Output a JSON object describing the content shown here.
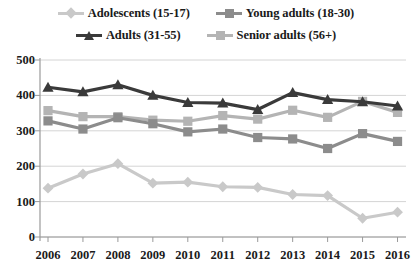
{
  "chart_data": {
    "type": "line",
    "title": "",
    "subtitle": "",
    "xlabel": "",
    "ylabel": "",
    "categories": [
      "2006",
      "2007",
      "2008",
      "2009",
      "2010",
      "2011",
      "2012",
      "2013",
      "2014",
      "2015",
      "2016"
    ],
    "x": [
      2006,
      2007,
      2008,
      2009,
      2010,
      2011,
      2012,
      2013,
      2014,
      2015,
      2016
    ],
    "ylim": [
      0,
      500
    ],
    "yticks": [
      0,
      100,
      200,
      300,
      400,
      500
    ],
    "grid": true,
    "legend_position": "top",
    "series": [
      {
        "name": "Adolescents (15-17)",
        "color": "#c9c9c9",
        "marker": "diamond",
        "values": [
          138,
          178,
          207,
          152,
          155,
          142,
          140,
          120,
          117,
          53,
          70
        ]
      },
      {
        "name": "Young adults (18-30)",
        "color": "#8c8c8c",
        "marker": "square",
        "values": [
          328,
          305,
          337,
          320,
          297,
          305,
          281,
          277,
          250,
          292,
          270
        ]
      },
      {
        "name": "Adults (31-55)",
        "color": "#3a3a3a",
        "marker": "triangle",
        "values": [
          423,
          410,
          430,
          400,
          380,
          378,
          360,
          408,
          388,
          382,
          370
        ]
      },
      {
        "name": "Senior adults (56+)",
        "color": "#b4b4b4",
        "marker": "square",
        "values": [
          357,
          340,
          340,
          330,
          327,
          343,
          333,
          358,
          338,
          383,
          352
        ]
      }
    ]
  },
  "legend": {
    "items": [
      {
        "label": "Adolescents (15-17)",
        "color": "#c9c9c9",
        "marker": "diamond"
      },
      {
        "label": "Young adults (18-30)",
        "color": "#8c8c8c",
        "marker": "square"
      },
      {
        "label": "Adults (31-55)",
        "color": "#3a3a3a",
        "marker": "triangle"
      },
      {
        "label": "Senior adults (56+)",
        "color": "#b4b4b4",
        "marker": "square"
      }
    ]
  },
  "axes": {
    "y_tick_labels": [
      "500",
      "400",
      "300",
      "200",
      "100",
      "0"
    ],
    "x_tick_labels": [
      "2006",
      "2007",
      "2008",
      "2009",
      "2010",
      "2011",
      "2012",
      "2013",
      "2014",
      "2015",
      "2016"
    ],
    "axis_color": "#9a9a9a",
    "grid_color": "#d4d4d4"
  }
}
